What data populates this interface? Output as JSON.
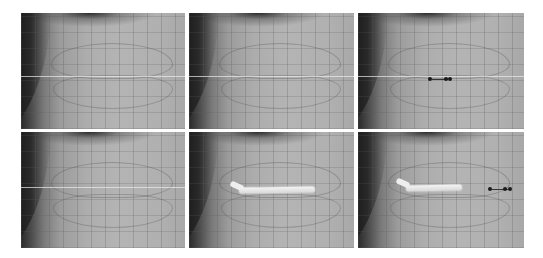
{
  "figure": {
    "layout": {
      "rows": 2,
      "cols": 3
    },
    "background_color": "#ffffff",
    "panels": [
      {
        "index": 1,
        "row": 1,
        "col": 1,
        "content": "wireframe mouth region, no annotation"
      },
      {
        "index": 2,
        "row": 1,
        "col": 2,
        "content": "wireframe mouth region, no annotation"
      },
      {
        "index": 3,
        "row": 1,
        "col": 3,
        "content": "wireframe mouth region with manipulator handle",
        "manipulator": true
      },
      {
        "index": 4,
        "row": 2,
        "col": 1,
        "content": "wireframe mouth region, lip line faintly highlighted"
      },
      {
        "index": 5,
        "row": 2,
        "col": 2,
        "content": "highlighted lip edge stroke",
        "stroke": true
      },
      {
        "index": 6,
        "row": 2,
        "col": 3,
        "content": "highlighted lip edge stroke with manipulator handle",
        "stroke": true,
        "manipulator": true
      }
    ]
  }
}
